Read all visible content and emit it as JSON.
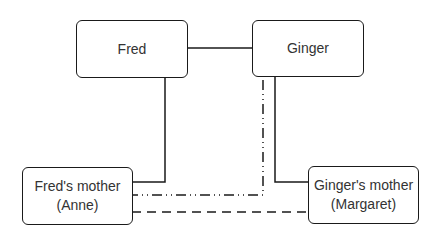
{
  "diagram": {
    "type": "family-relationship",
    "nodes": [
      {
        "id": "fred",
        "lines": [
          "Fred"
        ]
      },
      {
        "id": "ginger",
        "lines": [
          "Ginger"
        ]
      },
      {
        "id": "fred-mother",
        "lines": [
          "Fred's mother",
          "(Anne)"
        ]
      },
      {
        "id": "ginger-mother",
        "lines": [
          "Ginger's mother",
          "(Margaret)"
        ]
      }
    ],
    "edges": [
      {
        "from": "fred",
        "to": "ginger",
        "style": "solid"
      },
      {
        "from": "fred",
        "to": "fred-mother",
        "style": "solid"
      },
      {
        "from": "ginger",
        "to": "ginger-mother",
        "style": "solid"
      },
      {
        "from": "ginger",
        "to": "fred-mother",
        "style": "dash-dot-dot"
      },
      {
        "from": "fred-mother",
        "to": "ginger-mother",
        "style": "dashed"
      }
    ],
    "colors": {
      "stroke": "#1a1a1a",
      "text": "#333333",
      "background": "#ffffff"
    }
  }
}
